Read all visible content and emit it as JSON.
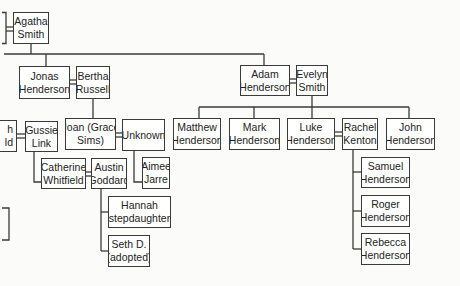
{
  "diagram": {
    "type": "family-tree",
    "colors": {
      "line": "#3a3a3a",
      "box_border": "#3a3a3a",
      "box_fill": "#ffffff",
      "text": "#222222",
      "background": "#fbfbfa"
    },
    "people": {
      "agatha": {
        "line1": "Agatha",
        "line2": "Smith"
      },
      "jonas": {
        "line1": "Jonas",
        "line2": "Henderson"
      },
      "bertha": {
        "line1": "Bertha",
        "line2": "Russell"
      },
      "adam": {
        "line1": "Adam",
        "line2": "Henderson"
      },
      "evelyn": {
        "line1": "Evelyn",
        "line2": "Smith"
      },
      "partial_left": {
        "line1": "h",
        "line2": "ld"
      },
      "gussie": {
        "line1": "Gussie",
        "line2": "Link"
      },
      "joan": {
        "line1": "Joan (Grace",
        "line2": "Sims)"
      },
      "unknown": {
        "line1": "Unknown",
        "line2": ""
      },
      "catherine": {
        "line1": "Catherine",
        "line2": "Whitfield"
      },
      "austin": {
        "line1": "Austin",
        "line2": "Goddard"
      },
      "aimee": {
        "line1": "Aimee",
        "line2": "Jarre"
      },
      "hannah": {
        "line1": "Hannah",
        "line2": "(stepdaughter)"
      },
      "seth": {
        "line1": "Seth D.",
        "line2": "(adopted)"
      },
      "matthew": {
        "line1": "Matthew",
        "line2": "Henderson"
      },
      "mark": {
        "line1": "Mark",
        "line2": "Henderson"
      },
      "luke": {
        "line1": "Luke",
        "line2": "Henderson"
      },
      "rachel": {
        "line1": "Rachel",
        "line2": "Kenton"
      },
      "john": {
        "line1": "John",
        "line2": "Henderson"
      },
      "samuel": {
        "line1": "Samuel",
        "line2": "Henderson"
      },
      "roger": {
        "line1": "Roger",
        "line2": "Henderson"
      },
      "rebecca": {
        "line1": "Rebecca",
        "line2": "Henderson"
      }
    },
    "marriages": [
      [
        "partial_left",
        "agatha"
      ],
      [
        "jonas",
        "bertha"
      ],
      [
        "adam",
        "evelyn"
      ],
      [
        "partial_left",
        "gussie"
      ],
      [
        "joan",
        "unknown"
      ],
      [
        "catherine",
        "austin"
      ],
      [
        "luke",
        "rachel"
      ]
    ]
  }
}
